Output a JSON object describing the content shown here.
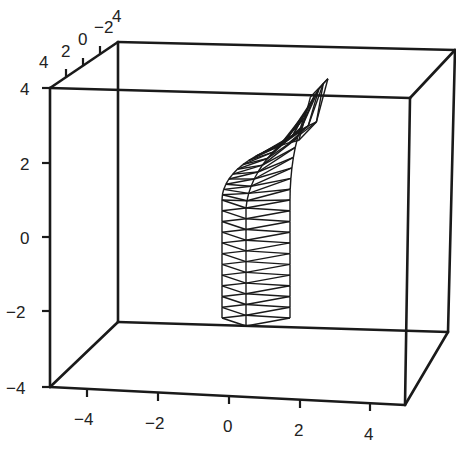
{
  "chart_data": {
    "type": "3d-wireframe",
    "title": "",
    "axes": {
      "x": {
        "range": [
          -5,
          5
        ],
        "ticks": [
          -4,
          -2,
          0,
          2,
          4
        ],
        "tick_labels": [
          "−4",
          "−2",
          "0",
          "2",
          "4"
        ]
      },
      "y": {
        "range": [
          -5,
          5
        ],
        "ticks": [
          4,
          2,
          0,
          -2,
          -4
        ],
        "tick_labels": [
          "4",
          "2",
          "0",
          "−2",
          "4"
        ]
      },
      "z": {
        "range": [
          -4,
          4
        ],
        "ticks": [
          4,
          2,
          0,
          -2,
          -4
        ],
        "tick_labels": [
          "4",
          "2",
          "0",
          "−2",
          "−4"
        ]
      }
    },
    "surface": {
      "shape": "bent tube",
      "straight_section_z": [
        -4,
        0
      ],
      "bend_section_z": [
        0,
        4
      ],
      "bend_direction": "+x",
      "segments_straight": 11,
      "segments_bend": 14
    },
    "grid": false,
    "box": true,
    "legend": null
  },
  "colors": {
    "line": "#1a1a1a",
    "background": "#ffffff"
  }
}
